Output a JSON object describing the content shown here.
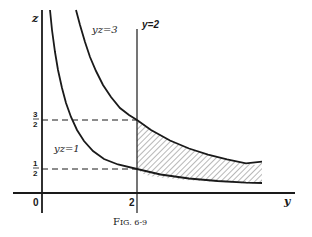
{
  "figure": {
    "caption": "Fig. 6-9",
    "caption_prefix": "F",
    "caption_rest": "IG. 6-9"
  },
  "axes": {
    "x_label": "y",
    "y_label": "z",
    "origin_label": "0",
    "x_tick_label": "2",
    "z_ticks": [
      {
        "num": "3",
        "den": "2",
        "value": 1.5
      },
      {
        "num": "1",
        "den": "2",
        "value": 0.5
      }
    ]
  },
  "curves": [
    {
      "label": "yz=3",
      "equation": "yz = 3"
    },
    {
      "label": "yz=1",
      "equation": "yz = 1"
    }
  ],
  "vertical_line": {
    "label": "y=2",
    "value": 2
  },
  "shaded_region": {
    "description": "Region bounded by y=2, yz=1 and yz=3 for y >= 2"
  },
  "colors": {
    "ink": "#1a1a1a",
    "background": "#ffffff"
  }
}
